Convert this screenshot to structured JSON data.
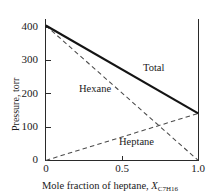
{
  "chart_data": {
    "type": "line",
    "title": "",
    "xlabel_prefix": "Mole fraction of  heptane, ",
    "xlabel_symbol": "X",
    "xlabel_sub_main": "C",
    "xlabel_sub_1": "7",
    "xlabel_sub_mid": "H",
    "xlabel_sub_2": "16",
    "ylabel": "Pressure,  torr",
    "xlim": [
      0,
      1.0
    ],
    "ylim": [
      0,
      430
    ],
    "xticks": [
      "0",
      "0.5",
      "1.0"
    ],
    "xtick_values": [
      0,
      0.5,
      1.0
    ],
    "yticks": [
      "0",
      "100",
      "200",
      "300",
      "400"
    ],
    "ytick_values": [
      0,
      100,
      200,
      300,
      400
    ],
    "grid": false,
    "legend_position": "inline-annotations",
    "series": [
      {
        "name": "Total",
        "style": "solid",
        "color": "#141414",
        "x": [
          0,
          1.0
        ],
        "values": [
          405,
          141
        ],
        "label_x": 0.64,
        "label_y": 247
      },
      {
        "name": "Hexane",
        "style": "dashed",
        "color": "#4a4a4a",
        "x": [
          0,
          1.0
        ],
        "values": [
          405,
          0
        ],
        "label_x": 0.24,
        "label_y": 200
      },
      {
        "name": "Heptane",
        "style": "dashed",
        "color": "#4a4a4a",
        "x": [
          0,
          1.0
        ],
        "values": [
          0,
          141
        ],
        "label_x": 0.53,
        "label_y": 62
      }
    ]
  },
  "axis": {
    "y_tick_400": "400",
    "y_tick_300": "300",
    "y_tick_200": "200",
    "y_tick_100": "100",
    "y_tick_0": "0",
    "x_tick_0": "0",
    "x_tick_05": "0.5",
    "x_tick_10": "1.0"
  },
  "annotations": {
    "total": "Total",
    "hexane": "Hexane",
    "heptane": "Heptane"
  }
}
